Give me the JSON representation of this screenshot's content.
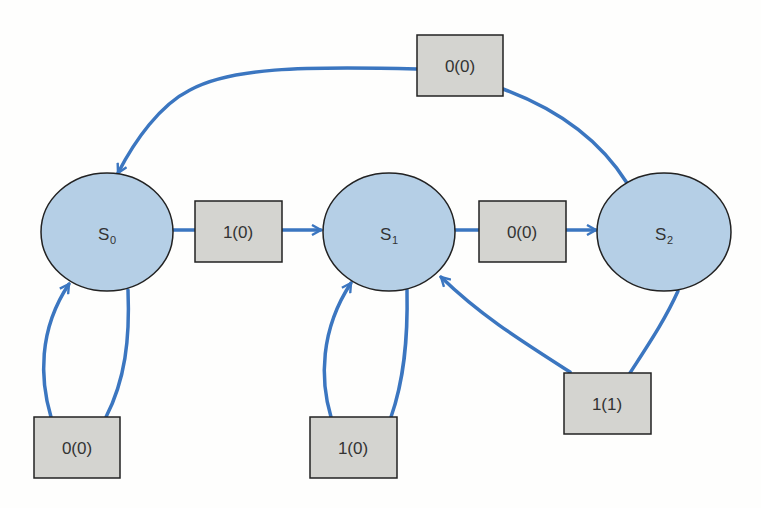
{
  "diagram": {
    "type": "state-transition",
    "colors": {
      "state_fill": "#b5cfe6",
      "box_fill": "#d4d4d0",
      "edge": "#3b76c0",
      "stroke": "#222222",
      "background": "#fefefd"
    },
    "states": [
      {
        "id": "S0",
        "main": "S",
        "sub": "0"
      },
      {
        "id": "S1",
        "main": "S",
        "sub": "1"
      },
      {
        "id": "S2",
        "main": "S",
        "sub": "2"
      }
    ],
    "transitions": [
      {
        "from": "S0",
        "to": "S0",
        "label": "0(0)"
      },
      {
        "from": "S0",
        "to": "S1",
        "label": "1(0)"
      },
      {
        "from": "S1",
        "to": "S1",
        "label": "1(0)"
      },
      {
        "from": "S1",
        "to": "S2",
        "label": "0(0)"
      },
      {
        "from": "S2",
        "to": "S1",
        "label": "1(1)"
      },
      {
        "from": "S2",
        "to": "S0",
        "label": "0(0)"
      }
    ]
  }
}
